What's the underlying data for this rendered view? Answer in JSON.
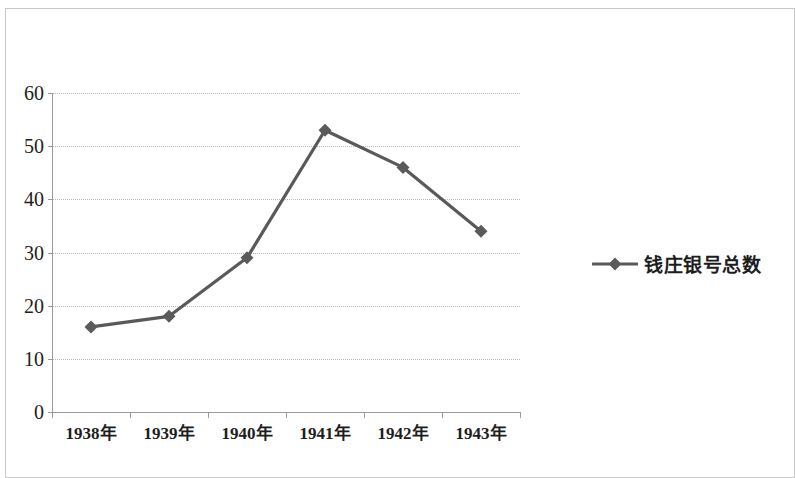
{
  "chart_data": {
    "type": "line",
    "title": "",
    "subtitle": "",
    "xlabel": "",
    "ylabel": "",
    "categories": [
      "1938年",
      "1939年",
      "1940年",
      "1941年",
      "1942年",
      "1943年"
    ],
    "series": [
      {
        "name": "钱庄银号总数",
        "values": [
          16,
          18,
          29,
          53,
          46,
          34
        ],
        "color": "#595959",
        "marker": "diamond"
      }
    ],
    "ylim": [
      0,
      60
    ],
    "yticks": [
      0,
      10,
      20,
      30,
      40,
      50,
      60
    ],
    "ytick_labels": [
      "0",
      "10",
      "20",
      "30",
      "40",
      "50",
      "60"
    ],
    "grid": "horizontal",
    "legend_position": "right",
    "legend_entries": [
      "钱庄银号总数"
    ],
    "colors": {
      "line": "#595959",
      "marker": "#5a5a5a",
      "gridline": "#b9b9b9",
      "axis": "#9a9a9a",
      "text": "#1d1d1d",
      "background": "#ffffff",
      "frame": "#c8c8c8"
    }
  },
  "legend": {
    "label": "钱庄银号总数"
  },
  "y_axis": {
    "ticks": [
      "60",
      "50",
      "40",
      "30",
      "20",
      "10",
      "0"
    ]
  },
  "x_axis": {
    "ticks": [
      "1938年",
      "1939年",
      "1940年",
      "1941年",
      "1942年",
      "1943年"
    ]
  }
}
